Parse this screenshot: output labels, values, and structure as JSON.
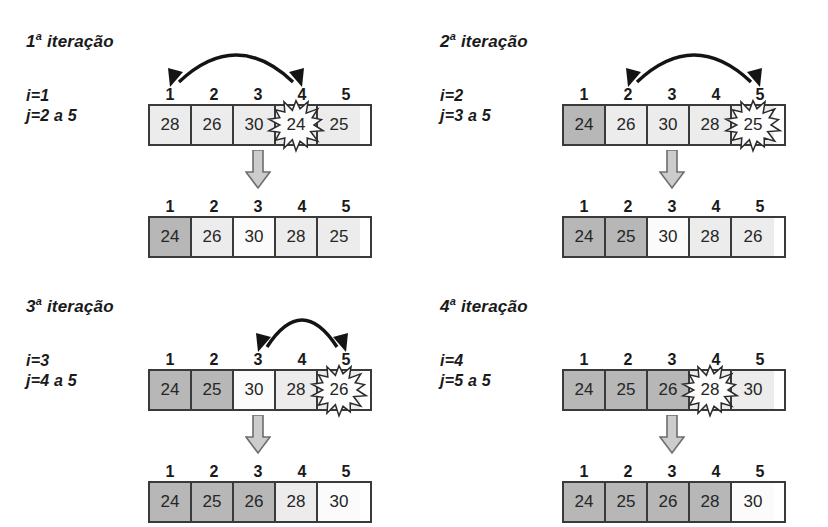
{
  "diagram": {
    "caption_language": "pt-BR",
    "index_labels": [
      "1",
      "2",
      "3",
      "4",
      "5"
    ],
    "colors": {
      "sorted_cell": "#b7b7b7",
      "light_cell": "#ececec",
      "white_cell": "#fbfbfb",
      "border": "#3a3a3a",
      "arrow": "#1a1a1a",
      "down_arrow_fill": "#c9c9c9"
    },
    "iterations": [
      {
        "title_number": "1",
        "title_ordinal": "a",
        "title_word": "iteração",
        "var_i": "i=1",
        "var_j": "j=2 a 5",
        "before": {
          "values": [
            "28",
            "26",
            "30",
            "24",
            "25"
          ],
          "shades": [
            "light",
            "light",
            "light",
            "light",
            "light"
          ],
          "burst_index": 4
        },
        "after": {
          "values": [
            "24",
            "26",
            "30",
            "28",
            "25"
          ],
          "shades": [
            "sorted",
            "light",
            "white",
            "light",
            "light"
          ]
        },
        "arc": {
          "from_index": 1,
          "to_index": 4,
          "visible": true
        }
      },
      {
        "title_number": "2",
        "title_ordinal": "a",
        "title_word": "iteração",
        "var_i": "i=2",
        "var_j": "j=3 a 5",
        "before": {
          "values": [
            "24",
            "26",
            "30",
            "28",
            "25"
          ],
          "shades": [
            "sorted",
            "light",
            "light",
            "light",
            "light"
          ],
          "burst_index": 5
        },
        "after": {
          "values": [
            "24",
            "25",
            "30",
            "28",
            "26"
          ],
          "shades": [
            "sorted",
            "sorted",
            "white",
            "light",
            "light"
          ]
        },
        "arc": {
          "from_index": 2,
          "to_index": 5,
          "visible": true
        }
      },
      {
        "title_number": "3",
        "title_ordinal": "a",
        "title_word": "iteração",
        "var_i": "i=3",
        "var_j": "j=4 a 5",
        "before": {
          "values": [
            "24",
            "25",
            "30",
            "28",
            "26"
          ],
          "shades": [
            "sorted",
            "sorted",
            "white",
            "light",
            "light"
          ],
          "burst_index": 5
        },
        "after": {
          "values": [
            "24",
            "25",
            "26",
            "28",
            "30"
          ],
          "shades": [
            "sorted",
            "sorted",
            "sorted",
            "light",
            "white"
          ]
        },
        "arc": {
          "from_index": 3,
          "to_index": 5,
          "visible": true
        }
      },
      {
        "title_number": "4",
        "title_ordinal": "a",
        "title_word": "iteração",
        "var_i": "i=4",
        "var_j": "j=5 a 5",
        "before": {
          "values": [
            "24",
            "25",
            "26",
            "28",
            "30"
          ],
          "shades": [
            "sorted",
            "sorted",
            "sorted",
            "light",
            "light"
          ],
          "burst_index": 4
        },
        "after": {
          "values": [
            "24",
            "25",
            "26",
            "28",
            "30"
          ],
          "shades": [
            "sorted",
            "sorted",
            "sorted",
            "sorted",
            "white"
          ]
        },
        "arc": {
          "from_index": 0,
          "to_index": 0,
          "visible": false
        }
      }
    ]
  }
}
